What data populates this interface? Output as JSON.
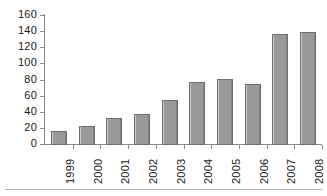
{
  "chart_data": {
    "type": "bar",
    "title": "",
    "subtitle": "",
    "xlabel": "",
    "ylabel": "",
    "categories": [
      "1999",
      "2000",
      "2001",
      "2002",
      "2003",
      "2004",
      "2005",
      "2006",
      "2007",
      "2008"
    ],
    "values": [
      18,
      24,
      33,
      39,
      56,
      78,
      82,
      76,
      138,
      140
    ],
    "series": [
      {
        "name": "",
        "values": [
          18,
          24,
          33,
          39,
          56,
          78,
          82,
          76,
          138,
          140
        ]
      }
    ],
    "ylim": [
      0,
      160
    ],
    "y_ticks": [
      0,
      20,
      40,
      60,
      80,
      100,
      120,
      140,
      160
    ],
    "y_tick_labels": [
      "0",
      "20",
      "40",
      "60",
      "80",
      "100",
      "120",
      "140",
      "160"
    ],
    "x_tick_labels": [
      "1999",
      "2000",
      "2001",
      "2002",
      "2003",
      "2004",
      "2005",
      "2006",
      "2007",
      "2008"
    ],
    "x_tick_label_rotation": 90,
    "grid": false,
    "legend": false,
    "legend_position": "none",
    "bar_color": "#9a9a9a",
    "bar_border_color": "#6e6e6e",
    "axis_color": "#8a8a8a",
    "background_color": "#ffffff"
  }
}
